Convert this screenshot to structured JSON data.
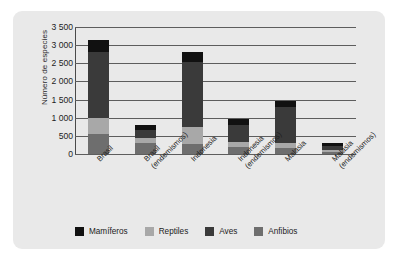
{
  "chart_data": {
    "type": "bar",
    "stacked": true,
    "title": "",
    "xlabel": "",
    "ylabel": "Número de especies",
    "ylim": [
      0,
      3500
    ],
    "ytick_step": 500,
    "ytick_labels": [
      "3 500",
      "3 000",
      "2 500",
      "2 000",
      "1 500",
      "1 000",
      "500",
      "0"
    ],
    "ytick_values": [
      3500,
      3000,
      2500,
      2000,
      1500,
      1000,
      500,
      0
    ],
    "grid": true,
    "legend_position": "bottom",
    "categories": [
      "Brasil",
      "Brasil (endemismos)",
      "Indonesia",
      "Indonesia (endemismos)",
      "Malasia",
      "Malasia (endemismos)"
    ],
    "category_lines": [
      [
        "Brasil"
      ],
      [
        "Brasil",
        "(endemismos)"
      ],
      [
        "Indonesia"
      ],
      [
        "Indonesia",
        "(endemismos)"
      ],
      [
        "Malasia"
      ],
      [
        "Malasia",
        "(endemismos)"
      ]
    ],
    "series": [
      {
        "name": "Anfibios",
        "color": "#6e6e6e",
        "values": [
          550,
          300,
          270,
          200,
          170,
          60
        ]
      },
      {
        "name": "Reptiles",
        "color": "#a8a8a8",
        "values": [
          450,
          130,
          480,
          130,
          130,
          40
        ]
      },
      {
        "name": "Aves",
        "color": "#3a3a3a",
        "values": [
          1800,
          220,
          1780,
          480,
          1000,
          130
        ]
      },
      {
        "name": "Mamíferos",
        "color": "#111111",
        "values": [
          350,
          150,
          270,
          160,
          150,
          70
        ]
      }
    ],
    "totals": [
      3150,
      800,
      2800,
      970,
      1450,
      300
    ],
    "legend": [
      {
        "label": "Mamíferos",
        "color": "#111111"
      },
      {
        "label": "Reptiles",
        "color": "#a8a8a8"
      },
      {
        "label": "Aves",
        "color": "#3a3a3a"
      },
      {
        "label": "Anfibios",
        "color": "#6e6e6e"
      }
    ],
    "colors": {
      "panel_background": "#e9e9e9",
      "page_background": "#ffffff",
      "gridline": "#5d5d5d",
      "axis": "#4a4a4a",
      "text": "#1d1d1d"
    }
  }
}
